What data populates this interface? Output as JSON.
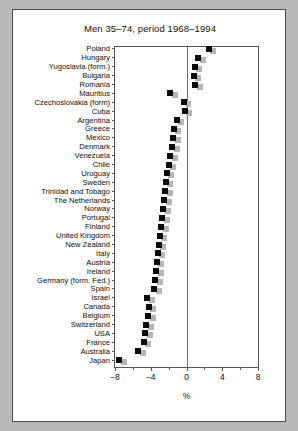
{
  "figure": {
    "title": "Men 35–74, period 1968–1994",
    "xaxis_title": "%",
    "background": "#ffffff",
    "page_background": "#b9b9b9"
  },
  "chart_data": {
    "type": "scatter",
    "title": "Men 35–74, period 1968–1994",
    "xlabel": "%",
    "ylabel": "",
    "xlim": [
      -8,
      8
    ],
    "xticks": [
      -8,
      -4,
      0,
      4,
      8
    ],
    "xticklabels": [
      "−8",
      "−4",
      "0",
      "4",
      "8"
    ],
    "minor_xticks": [
      -6,
      -2,
      2,
      6
    ],
    "grid": false,
    "legend": false,
    "zero_reference_line": 0,
    "marker": "filled-square",
    "marker_color": "#0b0b0b",
    "secondary_marker_color": "#b5b5b5",
    "categories": [
      "Poland",
      "Hungary",
      "Yugoslavia (form.)",
      "Bulgaria",
      "Romania",
      "Mauritius",
      "Czechoslovakia (form)",
      "Cuba",
      "Argentina",
      "Greece",
      "Mexico",
      "Denmark",
      "Venezuela",
      "Chile",
      "Uruguay",
      "Sweden",
      "Trinidad and Tobago",
      "The Netherlands",
      "Norway",
      "Portugal",
      "Finland",
      "United Kingdom",
      "New Zealand",
      "Italy",
      "Austria",
      "Ireland",
      "Germany (form. Fed.)",
      "Spain",
      "Israel",
      "Canada",
      "Belgium",
      "Switzerland",
      "USA",
      "France",
      "Australia",
      "Japan"
    ],
    "values": [
      2.5,
      1.3,
      0.9,
      0.8,
      1.0,
      -1.8,
      -0.3,
      -0.2,
      -1.1,
      -1.4,
      -1.5,
      -1.6,
      -1.8,
      -2.0,
      -2.2,
      -2.3,
      -2.4,
      -2.5,
      -2.6,
      -2.7,
      -2.8,
      -3.0,
      -3.1,
      -3.2,
      -3.3,
      -3.4,
      -3.5,
      -3.6,
      -4.4,
      -4.2,
      -4.3,
      -4.5,
      -4.6,
      -4.8,
      -5.4,
      -7.5
    ],
    "secondary_values": [
      3.0,
      1.8,
      1.4,
      1.3,
      1.5,
      -1.3,
      0.2,
      0.3,
      -0.6,
      -0.9,
      -1.0,
      -1.1,
      -1.3,
      -1.5,
      -1.7,
      -1.8,
      -1.9,
      -2.0,
      -2.1,
      -2.2,
      -2.3,
      -2.5,
      -2.6,
      -2.7,
      -2.8,
      -2.9,
      -3.0,
      -3.1,
      -3.9,
      -3.7,
      -3.8,
      -4.0,
      -4.1,
      -4.3,
      -4.9,
      -7.0
    ]
  }
}
